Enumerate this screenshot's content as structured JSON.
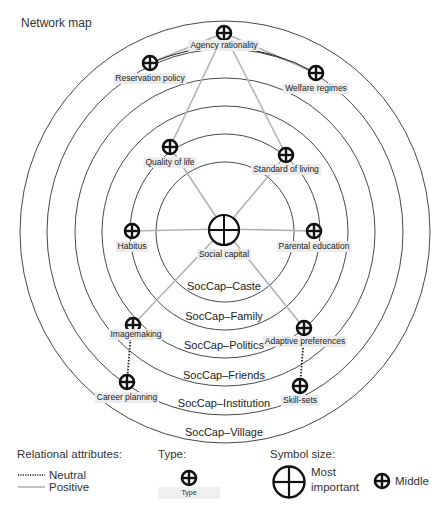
{
  "title": "Network map",
  "rings": [
    {
      "label": "SocCap–Caste",
      "rx": 69,
      "ry": 70
    },
    {
      "label": "SocCap–Family",
      "rx": 95,
      "ry": 98
    },
    {
      "label": "SocCap–Politics",
      "rx": 123,
      "ry": 126
    },
    {
      "label": "SocCap–Friends",
      "rx": 150,
      "ry": 154
    },
    {
      "label": "SocCap–Institution",
      "rx": 178,
      "ry": 183
    },
    {
      "label": "SocCap–Village",
      "rx": 205,
      "ry": 211
    }
  ],
  "nodes": [
    {
      "id": "agency",
      "label": "Agency rationality",
      "size": "middle"
    },
    {
      "id": "reservation",
      "label": "Reservation policy",
      "size": "middle"
    },
    {
      "id": "welfare",
      "label": "Welfare regimes",
      "size": "middle"
    },
    {
      "id": "quality",
      "label": "Quality of life",
      "size": "middle"
    },
    {
      "id": "standard",
      "label": "Standard of living",
      "size": "middle"
    },
    {
      "id": "habitus",
      "label": "Habitus",
      "size": "middle"
    },
    {
      "id": "social",
      "label": "Social capital",
      "size": "most_important"
    },
    {
      "id": "parental",
      "label": "Parental education",
      "size": "middle"
    },
    {
      "id": "imagemaking",
      "label": "Imagemaking",
      "size": "middle"
    },
    {
      "id": "adaptive",
      "label": "Adaptive preferences",
      "size": "middle"
    },
    {
      "id": "career",
      "label": "Career planning",
      "size": "middle"
    },
    {
      "id": "skills",
      "label": "Skill-sets",
      "size": "middle"
    }
  ],
  "edges": [
    {
      "from": "agency",
      "to": "reservation",
      "type": "positive"
    },
    {
      "from": "agency",
      "to": "welfare",
      "type": "positive"
    },
    {
      "from": "agency",
      "to": "quality",
      "type": "positive"
    },
    {
      "from": "agency",
      "to": "standard",
      "type": "positive"
    },
    {
      "from": "social",
      "to": "quality",
      "type": "positive"
    },
    {
      "from": "social",
      "to": "standard",
      "type": "positive"
    },
    {
      "from": "social",
      "to": "habitus",
      "type": "positive"
    },
    {
      "from": "social",
      "to": "parental",
      "type": "positive"
    },
    {
      "from": "social",
      "to": "imagemaking",
      "type": "positive"
    },
    {
      "from": "social",
      "to": "adaptive",
      "type": "positive"
    },
    {
      "from": "imagemaking",
      "to": "career",
      "type": "neutral"
    },
    {
      "from": "adaptive",
      "to": "skills",
      "type": "neutral"
    }
  ],
  "legend": {
    "relational_heading": "Relational attributes:",
    "neutral": "Neutral",
    "positive": "Positive",
    "type_heading": "Type:",
    "type_label": "Type",
    "size_heading": "Symbol size:",
    "most_important": "Most important",
    "most_line1": "Most",
    "most_line2": "important",
    "middle": "Middle"
  },
  "colors": {
    "ring": "#333333",
    "positive_edge": "#b3b3b3",
    "neutral_edge": "#222222",
    "symbol": "#111111",
    "label_bg": "#ececec"
  }
}
